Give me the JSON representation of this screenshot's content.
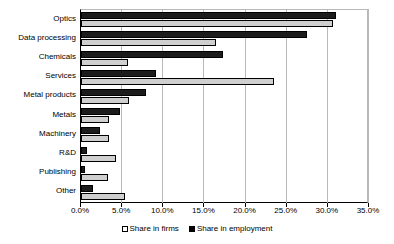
{
  "chart_data": {
    "type": "bar",
    "orientation": "horizontal",
    "title": "",
    "subtitle": "",
    "xlabel": "",
    "ylabel": "",
    "xlim": [
      0,
      35
    ],
    "xticks": [
      0,
      5,
      10,
      15,
      20,
      25,
      30,
      35
    ],
    "xtick_labels": [
      "0.0%",
      "5.0%",
      "10.0%",
      "15.0%",
      "20.0%",
      "25.0%",
      "30.0%",
      "35.0%"
    ],
    "grid": true,
    "grid_axis": "x",
    "legend_position": "bottom",
    "categories": [
      "Optics",
      "Data processing",
      "Chemicals",
      "Services",
      "Metal products",
      "Metals",
      "Machinery",
      "R&D",
      "Publishing",
      "Other"
    ],
    "series": [
      {
        "name": "Share in firms",
        "color": "#cfcfcf",
        "values": [
          30.6,
          16.4,
          5.7,
          23.5,
          5.8,
          3.4,
          3.4,
          4.2,
          3.3,
          5.3
        ]
      },
      {
        "name": "Share in employment",
        "color": "#1c1c1c",
        "values": [
          31.0,
          27.5,
          17.3,
          9.1,
          7.9,
          4.7,
          2.3,
          0.7,
          0.5,
          1.5
        ]
      }
    ]
  },
  "legend": {
    "items": [
      {
        "label": "Share in firms",
        "swatch": "light"
      },
      {
        "label": "Share in employment",
        "swatch": "dark"
      }
    ]
  }
}
